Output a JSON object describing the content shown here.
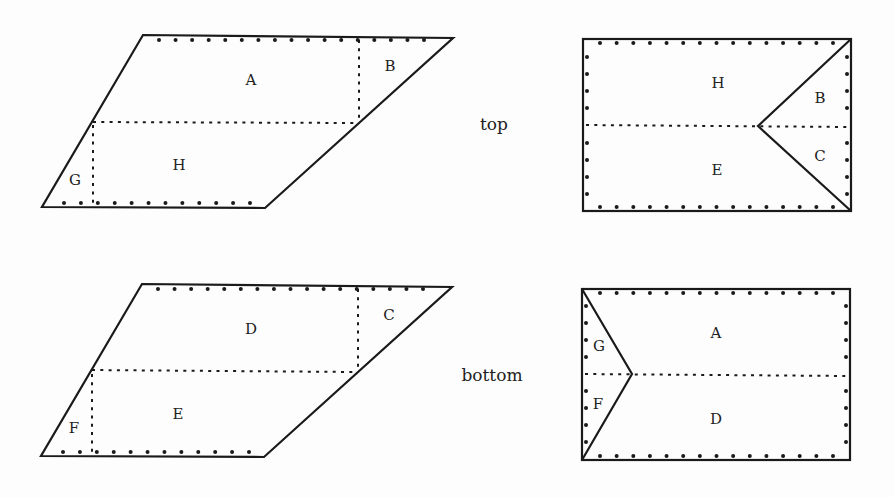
{
  "diagram": {
    "rows": [
      {
        "side_label": "top",
        "net": {
          "regions": {
            "top_main": "A",
            "top_corner": "B",
            "bottom_main": "H",
            "bottom_corner": "G"
          }
        },
        "folded": {
          "regions": {
            "upper": "H",
            "lower": "E",
            "wedge_upper": "B",
            "wedge_lower": "C"
          }
        }
      },
      {
        "side_label": "bottom",
        "net": {
          "regions": {
            "top_main": "D",
            "top_corner": "C",
            "bottom_main": "E",
            "bottom_corner": "F"
          }
        },
        "folded": {
          "regions": {
            "upper": "A",
            "lower": "D",
            "wedge_upper": "G",
            "wedge_lower": "F"
          }
        }
      }
    ]
  }
}
